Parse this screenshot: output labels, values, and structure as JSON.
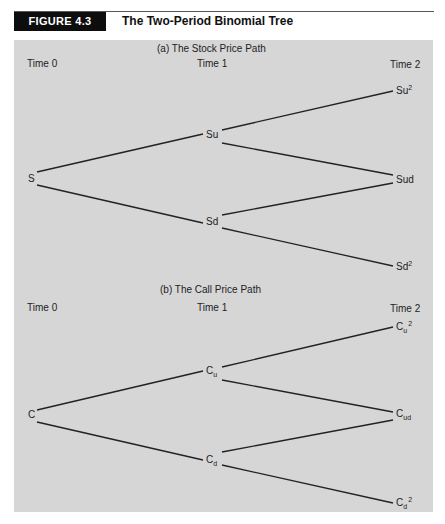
{
  "figure": {
    "label": "FIGURE 4.3",
    "title": "The Two-Period Binomial Tree",
    "colors": {
      "label_bg": "#0d0d0d",
      "panel_bg": "#d6d6d6",
      "line": "#222222"
    }
  },
  "panels": [
    {
      "title": "(a) The Stock Price Path",
      "time_labels": [
        "Time 0",
        "Time 1",
        "Time 2"
      ],
      "nodes": {
        "root": {
          "base": "S",
          "sub": "",
          "sup": ""
        },
        "up": {
          "base": "Su",
          "sub": "",
          "sup": ""
        },
        "down": {
          "base": "Sd",
          "sub": "",
          "sup": ""
        },
        "upup": {
          "base": "Su",
          "sub": "",
          "sup": "2"
        },
        "updown": {
          "base": "Sud",
          "sub": "",
          "sup": ""
        },
        "downdown": {
          "base": "Sd",
          "sub": "",
          "sup": "2"
        }
      }
    },
    {
      "title": "(b) The Call Price Path",
      "time_labels": [
        "Time 0",
        "Time 1",
        "Time 2"
      ],
      "nodes": {
        "root": {
          "base": "C",
          "sub": "",
          "sup": ""
        },
        "up": {
          "base": "C",
          "sub": "u",
          "sup": ""
        },
        "down": {
          "base": "C",
          "sub": "d",
          "sup": ""
        },
        "upup": {
          "base": "C",
          "sub": "u",
          "sup": "2"
        },
        "updown": {
          "base": "C",
          "sub": "ud",
          "sup": ""
        },
        "downdown": {
          "base": "C",
          "sub": "d",
          "sup": "2"
        }
      }
    }
  ],
  "edges": [
    [
      "root",
      "up"
    ],
    [
      "root",
      "down"
    ],
    [
      "up",
      "upup"
    ],
    [
      "up",
      "updown"
    ],
    [
      "down",
      "updown"
    ],
    [
      "down",
      "downdown"
    ]
  ]
}
